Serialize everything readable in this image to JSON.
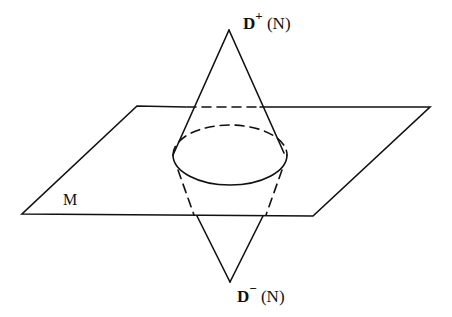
{
  "diagram": {
    "type": "geometric-figure",
    "labels": {
      "top": {
        "base": "D",
        "sup": "+",
        "arg": "(N)"
      },
      "bottom": {
        "base": "D",
        "sup": "−",
        "arg": "(N)"
      },
      "plane": "M"
    },
    "colors": {
      "stroke": "#111111",
      "background": "#ffffff"
    }
  }
}
